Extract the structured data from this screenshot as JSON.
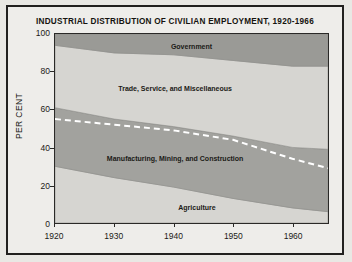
{
  "chart_data": {
    "type": "area",
    "title": "INDUSTRIAL DISTRIBUTION OF CIVILIAN EMPLOYMENT, 1920-1966",
    "xlabel": "",
    "ylabel": "PER CENT",
    "ylim": [
      0,
      100
    ],
    "xlim": [
      1920,
      1966
    ],
    "ytick_labels": [
      "0",
      "20",
      "40",
      "60",
      "80",
      "100"
    ],
    "ytick_values": [
      0,
      20,
      40,
      60,
      80,
      100
    ],
    "xtick_labels": [
      "1920",
      "1930",
      "1940",
      "1950",
      "1960"
    ],
    "xtick_values": [
      1920,
      1930,
      1940,
      1950,
      1960
    ],
    "grid": false,
    "legend": "inline-band-labels",
    "stacked": true,
    "x": [
      1920,
      1930,
      1940,
      1950,
      1960,
      1966
    ],
    "series": [
      {
        "name": "Agriculture",
        "color": "#d6d5d1",
        "label_x_pct": 52,
        "label_y_pct": 10,
        "values": [
          30,
          24,
          19,
          13,
          8,
          6
        ]
      },
      {
        "name": "Manufacturing, Mining, and Construction",
        "color": "#a2a29e",
        "label_x_pct": 44,
        "label_y_pct": 36,
        "values": [
          31,
          31,
          32,
          33,
          32,
          33
        ]
      },
      {
        "name": "Trade, Service, and Miscellaneous",
        "color": "#d6d5d1",
        "label_x_pct": 44,
        "label_y_pct": 73,
        "values": [
          33,
          35,
          38,
          40,
          43,
          44
        ]
      },
      {
        "name": "Government",
        "color": "#9a9a96",
        "label_x_pct": 50,
        "label_y_pct": 95,
        "values": [
          6,
          10,
          11,
          14,
          17,
          17
        ]
      }
    ],
    "overlay_line": {
      "name": "trend-dashed-line",
      "style": "dashed",
      "color": "#ffffff",
      "values": [
        55,
        52,
        49,
        44,
        34,
        29
      ]
    }
  }
}
